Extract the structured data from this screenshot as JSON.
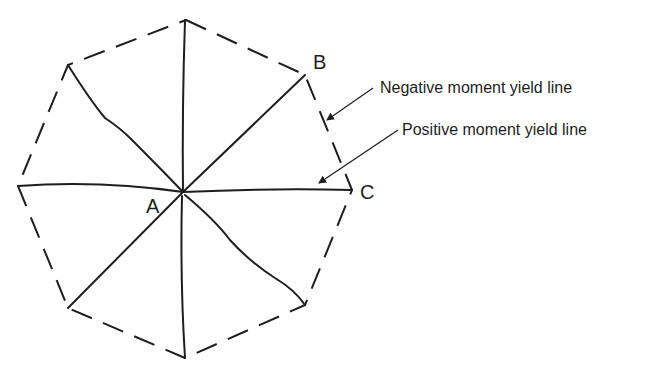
{
  "diagram": {
    "type": "yield-line pattern",
    "shape": "regular octagon slab",
    "colors": {
      "ink": "#1e1e1e",
      "background": "#ffffff"
    },
    "points": {
      "A": {
        "label": "A",
        "x": 183,
        "y": 192
      },
      "B": {
        "label": "B",
        "x": 305,
        "y": 75
      },
      "C": {
        "label": "C",
        "x": 352,
        "y": 190
      }
    },
    "vertices": [
      [
        186,
        20
      ],
      [
        305,
        75
      ],
      [
        352,
        190
      ],
      [
        305,
        305
      ],
      [
        185,
        358
      ],
      [
        68,
        308
      ],
      [
        18,
        186
      ],
      [
        68,
        65
      ]
    ],
    "annotations": {
      "negative": "Negative moment yield line",
      "positive": "Positive moment yield line"
    },
    "legend": {
      "negative_style": "dashed (slab boundary)",
      "positive_style": "solid (radial from A)"
    }
  }
}
